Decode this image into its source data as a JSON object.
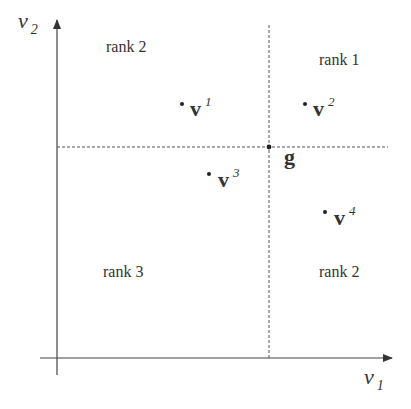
{
  "axes": {
    "x_label": "v",
    "x_sub": "1",
    "y_label": "v",
    "y_sub": "2"
  },
  "regions": {
    "top_left": "rank 2",
    "top_right": "rank 1",
    "bottom_left": "rank 3",
    "bottom_right": "rank 2"
  },
  "point_g": {
    "label": "g"
  },
  "vectors": [
    {
      "label": "v",
      "sup": "1"
    },
    {
      "label": "v",
      "sup": "2"
    },
    {
      "label": "v",
      "sup": "3"
    },
    {
      "label": "v",
      "sup": "4"
    }
  ],
  "colors": {
    "line": "#333333",
    "dashed": "#555555",
    "text": "#333333"
  }
}
